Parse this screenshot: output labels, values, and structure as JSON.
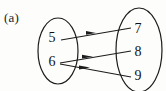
{
  "figure": {
    "label": "(a)",
    "type": "mapping-diagram",
    "background_color": "#fdfdfc",
    "ink_color": "#1c1c1c"
  },
  "domain_set": {
    "name": "left-oval",
    "cx": 58,
    "cy": 51,
    "rx": 20,
    "ry": 33,
    "elements": [
      {
        "value": "5",
        "x": 52,
        "y": 38
      },
      {
        "value": "6",
        "x": 52,
        "y": 62
      }
    ]
  },
  "codomain_set": {
    "name": "right-oval",
    "cx": 139,
    "cy": 50,
    "rx": 23,
    "ry": 42,
    "elements": [
      {
        "value": "7",
        "x": 138,
        "y": 29
      },
      {
        "value": "8",
        "x": 138,
        "y": 52
      },
      {
        "value": "9",
        "x": 138,
        "y": 76
      }
    ]
  },
  "arrows": [
    {
      "id": "arrow-5-to-7",
      "from": "5",
      "to": "7",
      "x1": 61,
      "y1": 40,
      "x2": 131,
      "y2": 28,
      "arrowhead_at": 0.45,
      "direction": "right"
    },
    {
      "id": "arrow-6-to-8",
      "from": "6",
      "to": "8",
      "x1": 60,
      "y1": 63,
      "x2": 131,
      "y2": 51,
      "arrowhead_at": 0.42,
      "direction": "right"
    },
    {
      "id": "arrow-6-to-9",
      "from": "6",
      "to": "9",
      "x1": 60,
      "y1": 64,
      "x2": 131,
      "y2": 77,
      "arrowhead_at": 0.38,
      "direction": "right"
    }
  ]
}
